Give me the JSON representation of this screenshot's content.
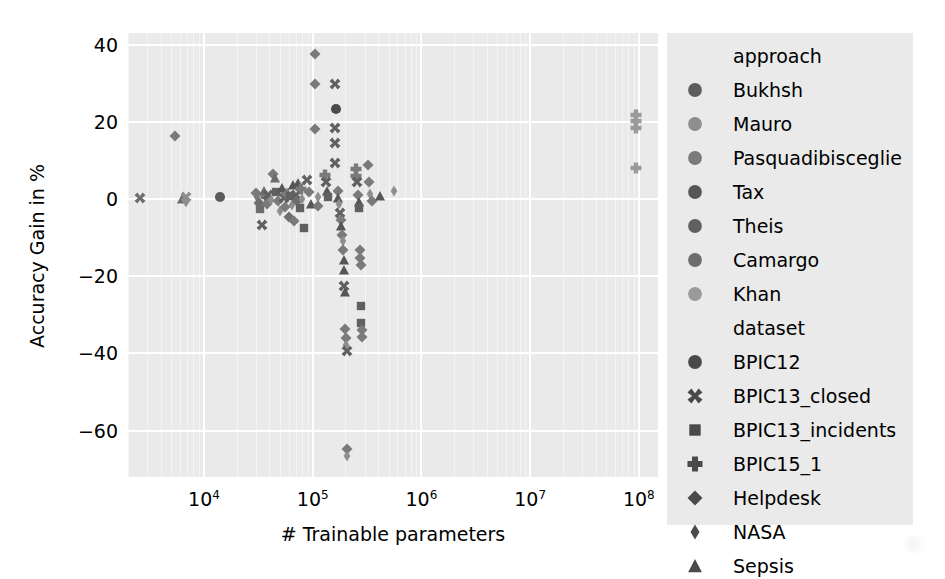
{
  "chart_data": {
    "type": "scatter",
    "title": "",
    "xlabel": "# Trainable parameters",
    "ylabel": "Accuracy Gain in %",
    "xscale": "log",
    "xlim": [
      2000,
      150000000
    ],
    "ylim": [
      -72,
      43
    ],
    "xticks": [
      "10",
      "10",
      "10",
      "10",
      "10"
    ],
    "xtick_exponents": [
      "4",
      "5",
      "6",
      "7",
      "8"
    ],
    "xtick_values": [
      10000,
      100000,
      1000000,
      10000000,
      100000000
    ],
    "yticks": [
      "40",
      "20",
      "0",
      "−20",
      "−40",
      "−60"
    ],
    "ytick_values": [
      40,
      20,
      0,
      -20,
      -40,
      -60
    ],
    "grid": true,
    "grid_color": "#ffffff",
    "plot_background": "#eaeaea",
    "legend_position": "right-outside",
    "legend_groups": [
      {
        "title": "approach",
        "marker_shape": "circle",
        "entries": [
          {
            "label": "Bukhsh",
            "color": "#5c5c5c"
          },
          {
            "label": "Mauro",
            "color": "#8e8e8e"
          },
          {
            "label": "Pasquadibisceglie",
            "color": "#7a7a7a"
          },
          {
            "label": "Tax",
            "color": "#565656"
          },
          {
            "label": "Theis",
            "color": "#606060"
          },
          {
            "label": "Camargo",
            "color": "#6d6d6d"
          },
          {
            "label": "Khan",
            "color": "#9a9a9a"
          }
        ]
      },
      {
        "title": "dataset",
        "entries": [
          {
            "label": "BPIC12",
            "marker_shape": "circle",
            "color": "#4a4a4a"
          },
          {
            "label": "BPIC13_closed",
            "marker_shape": "x",
            "color": "#4a4a4a"
          },
          {
            "label": "BPIC13_incidents",
            "marker_shape": "square",
            "color": "#4a4a4a"
          },
          {
            "label": "BPIC15_1",
            "marker_shape": "plus-filled",
            "color": "#4a4a4a"
          },
          {
            "label": "Helpdesk",
            "marker_shape": "diamond",
            "color": "#4a4a4a"
          },
          {
            "label": "NASA",
            "marker_shape": "thin-diamond",
            "color": "#4a4a4a"
          },
          {
            "label": "Sepsis",
            "marker_shape": "triangle-up",
            "color": "#4a4a4a"
          }
        ]
      }
    ],
    "points": [
      {
        "x": 2600,
        "y": 0.2,
        "shape": "x",
        "color": "#6d6d6d"
      },
      {
        "x": 5400,
        "y": 16.2,
        "shape": "diamond",
        "color": "#7a7a7a"
      },
      {
        "x": 6300,
        "y": 0.0,
        "shape": "triangle-up",
        "color": "#6d6d6d"
      },
      {
        "x": 6900,
        "y": 0.6,
        "shape": "x",
        "color": "#8e8e8e"
      },
      {
        "x": 6900,
        "y": -0.8,
        "shape": "thin-diamond",
        "color": "#8e8e8e"
      },
      {
        "x": 14000,
        "y": 0.4,
        "shape": "circle",
        "color": "#5c5c5c"
      },
      {
        "x": 30000,
        "y": 1.6,
        "shape": "diamond",
        "color": "#7a7a7a"
      },
      {
        "x": 31000,
        "y": 0.5,
        "shape": "thin-diamond",
        "color": "#7a7a7a"
      },
      {
        "x": 32000,
        "y": -1.0,
        "shape": "diamond",
        "color": "#6d6d6d"
      },
      {
        "x": 33000,
        "y": -2.6,
        "shape": "square",
        "color": "#6d6d6d"
      },
      {
        "x": 34000,
        "y": -6.8,
        "shape": "x",
        "color": "#606060"
      },
      {
        "x": 36000,
        "y": 2.2,
        "shape": "triangle-up",
        "color": "#6d6d6d"
      },
      {
        "x": 37000,
        "y": 0.6,
        "shape": "plus-filled",
        "color": "#7a7a7a"
      },
      {
        "x": 38000,
        "y": -1.4,
        "shape": "diamond",
        "color": "#7a7a7a"
      },
      {
        "x": 39000,
        "y": 1.1,
        "shape": "x",
        "color": "#606060"
      },
      {
        "x": 41000,
        "y": -0.2,
        "shape": "thin-diamond",
        "color": "#8e8e8e"
      },
      {
        "x": 43000,
        "y": 6.5,
        "shape": "diamond",
        "color": "#7a7a7a"
      },
      {
        "x": 45000,
        "y": 5.4,
        "shape": "triangle-up",
        "color": "#6d6d6d"
      },
      {
        "x": 46000,
        "y": 1.9,
        "shape": "square",
        "color": "#606060"
      },
      {
        "x": 48000,
        "y": -0.6,
        "shape": "diamond",
        "color": "#7a7a7a"
      },
      {
        "x": 50000,
        "y": -3.2,
        "shape": "thin-diamond",
        "color": "#8e8e8e"
      },
      {
        "x": 52000,
        "y": 2.8,
        "shape": "triangle-up",
        "color": "#565656"
      },
      {
        "x": 54000,
        "y": 0.2,
        "shape": "x",
        "color": "#606060"
      },
      {
        "x": 56000,
        "y": -2.0,
        "shape": "diamond",
        "color": "#7a7a7a"
      },
      {
        "x": 58000,
        "y": 1.4,
        "shape": "plus-filled",
        "color": "#7a7a7a"
      },
      {
        "x": 60000,
        "y": -4.6,
        "shape": "diamond",
        "color": "#6d6d6d"
      },
      {
        "x": 62000,
        "y": 0.9,
        "shape": "square",
        "color": "#606060"
      },
      {
        "x": 64000,
        "y": -1.6,
        "shape": "thin-diamond",
        "color": "#8e8e8e"
      },
      {
        "x": 66000,
        "y": 3.6,
        "shape": "triangle-up",
        "color": "#565656"
      },
      {
        "x": 68000,
        "y": -5.8,
        "shape": "diamond",
        "color": "#7a7a7a"
      },
      {
        "x": 70000,
        "y": 1.0,
        "shape": "x",
        "color": "#606060"
      },
      {
        "x": 72000,
        "y": -0.4,
        "shape": "diamond",
        "color": "#6d6d6d"
      },
      {
        "x": 74000,
        "y": 4.1,
        "shape": "triangle-up",
        "color": "#565656"
      },
      {
        "x": 76000,
        "y": -2.2,
        "shape": "square",
        "color": "#606060"
      },
      {
        "x": 78000,
        "y": 2.6,
        "shape": "plus-filled",
        "color": "#7a7a7a"
      },
      {
        "x": 80000,
        "y": 0.0,
        "shape": "thin-diamond",
        "color": "#8e8e8e"
      },
      {
        "x": 84000,
        "y": -7.4,
        "shape": "square",
        "color": "#606060"
      },
      {
        "x": 88000,
        "y": 5.0,
        "shape": "x",
        "color": "#606060"
      },
      {
        "x": 92000,
        "y": 1.8,
        "shape": "diamond",
        "color": "#7a7a7a"
      },
      {
        "x": 96000,
        "y": -1.2,
        "shape": "triangle-up",
        "color": "#565656"
      },
      {
        "x": 105000,
        "y": 37.5,
        "shape": "diamond",
        "color": "#7a7a7a"
      },
      {
        "x": 105000,
        "y": 29.8,
        "shape": "diamond",
        "color": "#7a7a7a"
      },
      {
        "x": 105000,
        "y": 18.2,
        "shape": "diamond",
        "color": "#7a7a7a"
      },
      {
        "x": 112000,
        "y": 0.4,
        "shape": "thin-diamond",
        "color": "#8e8e8e"
      },
      {
        "x": 112000,
        "y": -1.8,
        "shape": "diamond",
        "color": "#7a7a7a"
      },
      {
        "x": 130000,
        "y": 6.3,
        "shape": "plus-filled",
        "color": "#7a7a7a"
      },
      {
        "x": 132000,
        "y": 4.4,
        "shape": "x",
        "color": "#606060"
      },
      {
        "x": 134000,
        "y": 2.2,
        "shape": "triangle-up",
        "color": "#565656"
      },
      {
        "x": 138000,
        "y": 0.6,
        "shape": "square",
        "color": "#606060"
      },
      {
        "x": 160000,
        "y": 29.9,
        "shape": "x",
        "color": "#606060"
      },
      {
        "x": 165000,
        "y": 23.4,
        "shape": "circle",
        "color": "#4a4a4a"
      },
      {
        "x": 160000,
        "y": 18.4,
        "shape": "x",
        "color": "#606060"
      },
      {
        "x": 160000,
        "y": 14.5,
        "shape": "x",
        "color": "#606060"
      },
      {
        "x": 160000,
        "y": 9.4,
        "shape": "x",
        "color": "#606060"
      },
      {
        "x": 170000,
        "y": 2.0,
        "shape": "diamond",
        "color": "#7a7a7a"
      },
      {
        "x": 172000,
        "y": 0.2,
        "shape": "triangle-up",
        "color": "#565656"
      },
      {
        "x": 176000,
        "y": -1.2,
        "shape": "thin-diamond",
        "color": "#8e8e8e"
      },
      {
        "x": 180000,
        "y": -3.6,
        "shape": "x",
        "color": "#606060"
      },
      {
        "x": 182000,
        "y": -5.4,
        "shape": "diamond",
        "color": "#7a7a7a"
      },
      {
        "x": 184000,
        "y": -7.0,
        "shape": "triangle-up",
        "color": "#565656"
      },
      {
        "x": 186000,
        "y": -9.2,
        "shape": "diamond",
        "color": "#7a7a7a"
      },
      {
        "x": 188000,
        "y": -11.0,
        "shape": "thin-diamond",
        "color": "#8e8e8e"
      },
      {
        "x": 190000,
        "y": -13.2,
        "shape": "diamond",
        "color": "#7a7a7a"
      },
      {
        "x": 192000,
        "y": -15.8,
        "shape": "triangle-up",
        "color": "#565656"
      },
      {
        "x": 194000,
        "y": -18.4,
        "shape": "triangle-up",
        "color": "#565656"
      },
      {
        "x": 196000,
        "y": -22.6,
        "shape": "x",
        "color": "#606060"
      },
      {
        "x": 198000,
        "y": -24.0,
        "shape": "triangle-up",
        "color": "#565656"
      },
      {
        "x": 200000,
        "y": -33.6,
        "shape": "diamond",
        "color": "#7a7a7a"
      },
      {
        "x": 202000,
        "y": -36.0,
        "shape": "diamond",
        "color": "#7a7a7a"
      },
      {
        "x": 204000,
        "y": -37.8,
        "shape": "thin-diamond",
        "color": "#8e8e8e"
      },
      {
        "x": 206000,
        "y": -39.4,
        "shape": "x",
        "color": "#606060"
      },
      {
        "x": 208000,
        "y": -64.8,
        "shape": "diamond",
        "color": "#7a7a7a"
      },
      {
        "x": 208000,
        "y": -66.6,
        "shape": "thin-diamond",
        "color": "#8e8e8e"
      },
      {
        "x": 250000,
        "y": 7.8,
        "shape": "plus-filled",
        "color": "#7a7a7a"
      },
      {
        "x": 252000,
        "y": 5.9,
        "shape": "plus-filled",
        "color": "#7a7a7a"
      },
      {
        "x": 256000,
        "y": 4.4,
        "shape": "x",
        "color": "#606060"
      },
      {
        "x": 260000,
        "y": 1.0,
        "shape": "diamond",
        "color": "#7a7a7a"
      },
      {
        "x": 264000,
        "y": -0.8,
        "shape": "triangle-up",
        "color": "#565656"
      },
      {
        "x": 268000,
        "y": -2.4,
        "shape": "square",
        "color": "#606060"
      },
      {
        "x": 272000,
        "y": -13.2,
        "shape": "diamond",
        "color": "#7a7a7a"
      },
      {
        "x": 274000,
        "y": -15.4,
        "shape": "diamond",
        "color": "#7a7a7a"
      },
      {
        "x": 276000,
        "y": -17.0,
        "shape": "diamond",
        "color": "#7a7a7a"
      },
      {
        "x": 278000,
        "y": -27.8,
        "shape": "square",
        "color": "#606060"
      },
      {
        "x": 280000,
        "y": -32.0,
        "shape": "square",
        "color": "#606060"
      },
      {
        "x": 282000,
        "y": -34.0,
        "shape": "diamond",
        "color": "#7a7a7a"
      },
      {
        "x": 284000,
        "y": -35.8,
        "shape": "diamond",
        "color": "#7a7a7a"
      },
      {
        "x": 320000,
        "y": 8.8,
        "shape": "diamond",
        "color": "#7a7a7a"
      },
      {
        "x": 330000,
        "y": 4.4,
        "shape": "diamond",
        "color": "#7a7a7a"
      },
      {
        "x": 340000,
        "y": 1.2,
        "shape": "thin-diamond",
        "color": "#8e8e8e"
      },
      {
        "x": 350000,
        "y": -0.6,
        "shape": "diamond",
        "color": "#7a7a7a"
      },
      {
        "x": 420000,
        "y": 0.8,
        "shape": "triangle-up",
        "color": "#565656"
      },
      {
        "x": 560000,
        "y": 2.2,
        "shape": "thin-diamond",
        "color": "#8e8e8e"
      },
      {
        "x": 95000000,
        "y": 21.8,
        "shape": "plus-filled",
        "color": "#9a9a9a"
      },
      {
        "x": 95000000,
        "y": 20.2,
        "shape": "plus-filled",
        "color": "#9a9a9a"
      },
      {
        "x": 95000000,
        "y": 18.4,
        "shape": "plus-filled",
        "color": "#9a9a9a"
      },
      {
        "x": 95000000,
        "y": 8.0,
        "shape": "plus-filled",
        "color": "#9a9a9a"
      }
    ]
  }
}
